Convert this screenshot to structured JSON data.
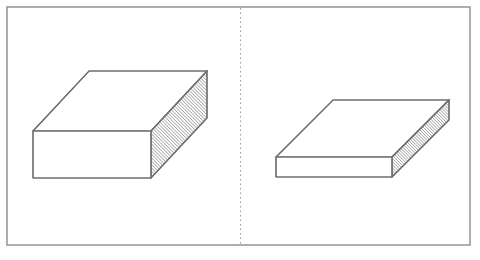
{
  "document": {
    "kind": "line-drawing",
    "title": "Two stacked-sheet blocks separated by a dotted divider",
    "background_color": "#fefefe",
    "width": 480,
    "height": 260
  },
  "frame": {
    "name": "outer-border",
    "stroke_color": "#8c8c8c",
    "stroke_width": 1.4,
    "x": 7,
    "y": 7,
    "width": 463,
    "height": 238,
    "fill": "#ffffff"
  },
  "divider": {
    "name": "vertical-dotted-divider",
    "orientation": "vertical",
    "x": 240,
    "y_top": 8,
    "y_bottom": 244,
    "stroke_color": "#9a9a9a",
    "stroke_width": 1.1,
    "dash_pattern": "1.5 3"
  },
  "panels": [
    {
      "id": "left-panel",
      "label": "",
      "object": {
        "name": "thick-sheet-stack",
        "description": "Tall rectangular block drawn in oblique projection, right-hand face filled with dense diagonal hatching representing many stacked sheets",
        "stroke_color": "#6e6e6e",
        "face_fill": "#ffffff",
        "hatch_color": "#7a7a7a",
        "hatch_spacing": 1.6,
        "hatch_line_width": 0.75,
        "geometry": {
          "front_top_left": [
            33,
            131
          ],
          "front_top_right": [
            151,
            131
          ],
          "front_bottom_left": [
            33,
            178
          ],
          "front_bottom_right": [
            151,
            178
          ],
          "back_top_left": [
            89,
            71
          ],
          "back_top_right": [
            207,
            71
          ],
          "back_bottom_right": [
            207,
            118
          ]
        }
      }
    },
    {
      "id": "right-panel",
      "label": "",
      "object": {
        "name": "thin-sheet-stack",
        "description": "Flat rectangular block drawn in oblique projection, right-hand face filled with dense diagonal hatching representing a few stacked sheets",
        "stroke_color": "#6e6e6e",
        "face_fill": "#ffffff",
        "hatch_color": "#7a7a7a",
        "hatch_spacing": 1.6,
        "hatch_line_width": 0.75,
        "geometry": {
          "front_top_left": [
            276,
            157
          ],
          "front_top_right": [
            392,
            157
          ],
          "front_bottom_left": [
            276,
            177
          ],
          "front_bottom_right": [
            392,
            177
          ],
          "back_top_left": [
            333,
            100
          ],
          "back_top_right": [
            449,
            100
          ],
          "back_bottom_right": [
            449,
            120
          ]
        }
      }
    }
  ],
  "captions": {
    "left_ghost": "",
    "right_ghost": ""
  }
}
